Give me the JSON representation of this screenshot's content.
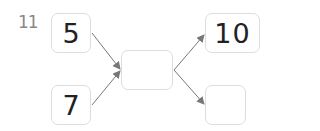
{
  "problem_number": "11",
  "diagram": {
    "inputs": [
      {
        "value": "5"
      },
      {
        "value": "7"
      }
    ],
    "middle": {
      "value": ""
    },
    "outputs": [
      {
        "value": "10"
      },
      {
        "value": ""
      }
    ],
    "colors": {
      "box_border": "#dddddd",
      "arrow": "#777777",
      "text": "#222222",
      "label": "#888888"
    }
  }
}
